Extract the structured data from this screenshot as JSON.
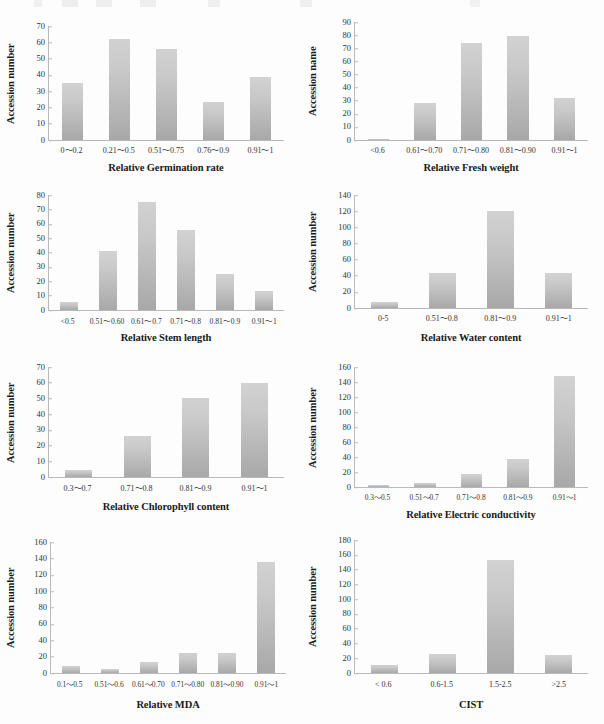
{
  "figure": {
    "panel_count": 8,
    "bar_color": "#c4c4c4",
    "axis_color": "#b9b9b9",
    "text_color": "#231f20"
  },
  "chart_data": [
    {
      "id": "germination-rate",
      "type": "bar",
      "title": "",
      "xlabel": "Relative Germination rate",
      "ylabel": "Accession number",
      "categories": [
        "0～0.2",
        "0.21～0.5",
        "0.51～0.75",
        "0.76～0.9",
        "0.91～1"
      ],
      "values": [
        35,
        62,
        56,
        23.5,
        39
      ],
      "yticks": [
        0,
        10,
        20,
        30,
        40,
        50,
        60,
        70
      ],
      "ylim": [
        0,
        70
      ],
      "grid": false,
      "legend": "none"
    },
    {
      "id": "fresh-weight",
      "type": "bar",
      "title": "",
      "xlabel": "Relative Fresh weight",
      "ylabel": "Accession name",
      "categories": [
        "<0.6",
        "0.61～0.70",
        "0.71～0.80",
        "0.81～0.90",
        "0.91～1"
      ],
      "values": [
        1,
        28,
        74,
        79,
        32
      ],
      "yticks": [
        0,
        10,
        20,
        30,
        40,
        50,
        60,
        70,
        80,
        90
      ],
      "ylim": [
        0,
        90
      ],
      "grid": false,
      "legend": "none"
    },
    {
      "id": "stem-length",
      "type": "bar",
      "title": "",
      "xlabel": "Relative Stem length",
      "ylabel": "Accession number",
      "categories": [
        "<0.5",
        "0.51～0.60",
        "0.61～0.7",
        "0.71～0.8",
        "0.81～0.9",
        "0.91～1"
      ],
      "values": [
        5.5,
        41,
        75,
        55.5,
        25,
        13.5
      ],
      "yticks": [
        0,
        10,
        20,
        30,
        40,
        50,
        60,
        70,
        80
      ],
      "ylim": [
        0,
        80
      ],
      "grid": false,
      "legend": "none"
    },
    {
      "id": "water-content",
      "type": "bar",
      "title": "",
      "xlabel": "Relative Water content",
      "ylabel": "Accession number",
      "categories": [
        "0-5",
        "0.51～0.8",
        "0.81～0.9",
        "0.91～1"
      ],
      "values": [
        7,
        44,
        120,
        43.5
      ],
      "yticks": [
        0,
        20,
        40,
        60,
        80,
        100,
        120,
        140
      ],
      "ylim": [
        0,
        140
      ],
      "grid": false,
      "legend": "none"
    },
    {
      "id": "chlorophyll-content",
      "type": "bar",
      "title": "",
      "xlabel": "Relative Chlorophyll content",
      "ylabel": "Accession number",
      "categories": [
        "0.3～0.7",
        "0.71～0.8",
        "0.81～0.9",
        "0.91～1"
      ],
      "values": [
        4.5,
        26,
        50.5,
        60
      ],
      "yticks": [
        0,
        10,
        20,
        30,
        40,
        50,
        60,
        70
      ],
      "ylim": [
        0,
        70
      ],
      "grid": false,
      "legend": "none"
    },
    {
      "id": "electric-conductivity",
      "type": "bar",
      "title": "",
      "xlabel": "Relative Electric conductivity",
      "ylabel": "Accession number",
      "categories": [
        "0.3～0.5",
        "0.51～0.7",
        "0.71～0.8",
        "0.81～0.9",
        "0.91～1"
      ],
      "values": [
        2.5,
        5.5,
        18,
        37,
        148
      ],
      "yticks": [
        0,
        20,
        40,
        60,
        80,
        100,
        120,
        140,
        160
      ],
      "ylim": [
        0,
        160
      ],
      "grid": false,
      "legend": "none"
    },
    {
      "id": "relative-mda",
      "type": "bar",
      "title": "",
      "xlabel": "Relative MDA",
      "ylabel": "Accession number",
      "categories": [
        "0.1～0.5",
        "0.51～0.6",
        "0.61～0.70",
        "0.71～0.80",
        "0.81～0.90",
        "0.91～1"
      ],
      "values": [
        8.5,
        5,
        14,
        25,
        25,
        136
      ],
      "yticks": [
        0,
        20,
        40,
        60,
        80,
        100,
        120,
        140,
        160
      ],
      "ylim": [
        0,
        160
      ],
      "grid": false,
      "legend": "none"
    },
    {
      "id": "cist",
      "type": "bar",
      "title": "",
      "xlabel": "CIST",
      "ylabel": "Accession number",
      "categories": [
        "< 0.6",
        "0.6-1.5",
        "1.5-2.5",
        ">2.5"
      ],
      "values": [
        11,
        25.5,
        153,
        24
      ],
      "yticks": [
        0,
        20,
        40,
        60,
        80,
        100,
        120,
        140,
        160,
        180
      ],
      "ylim": [
        0,
        180
      ],
      "grid": false,
      "legend": "none"
    }
  ]
}
